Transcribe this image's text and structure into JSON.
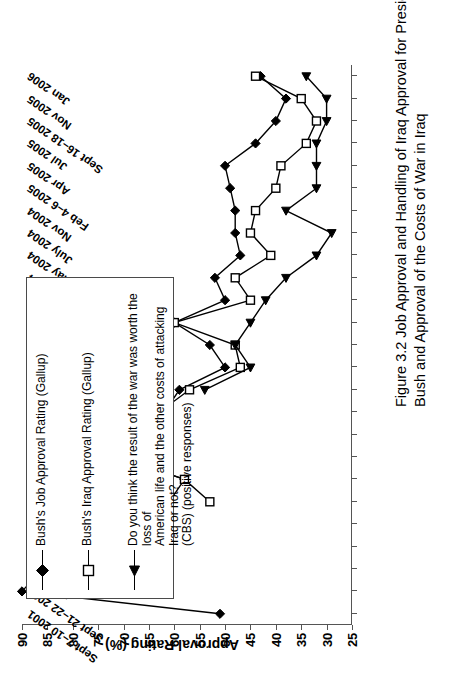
{
  "figure": {
    "caption_line1": "Figure 3.2  Job Approval and Handling of Iraq Approval for President",
    "caption_line2": "Bush and Approval of the Costs of War in Iraq"
  },
  "legend": {
    "items": [
      {
        "marker": "filled-diamond",
        "label": "Bush's Job Approval Rating  (Gallup)"
      },
      {
        "marker": "open-square",
        "label": "Bush's Iraq Approval Rating  (Gallup)"
      },
      {
        "marker": "filled-triangle",
        "label": "Do you think the result of the war was worth the loss of\nAmerican life and the other costs of attacking Iraq or not?\n(CBS) (positive responses)"
      }
    ]
  },
  "chart_data": {
    "type": "line",
    "title": "Job Approval and Handling of Iraq Approval for President Bush and Approval of the Costs of War in Iraq",
    "xlabel": "",
    "ylabel": "Approval Rating (%)",
    "ylim": [
      25,
      90
    ],
    "yticks": [
      25,
      30,
      35,
      40,
      45,
      50,
      55,
      60,
      65,
      70,
      75,
      80,
      85,
      90
    ],
    "grid": false,
    "legend_position": "top-left",
    "orientation": "page-rotated-90ccw",
    "categories": [
      "Sept 7–10 2001",
      "Sept 21–22 2001",
      "Dec 2001",
      "June 2002",
      "Oct 2002",
      "Feb 2003",
      "Mar 14–15 2003",
      "Mar 22–23 2003",
      "Apr 2003",
      "June 2003",
      "Aug 2003",
      "Nov 2003",
      "Dec 2003",
      "Jan 2–5 2004",
      "Mar 2004",
      "Apr 2004",
      "May 2004",
      "July 2004",
      "Nov 2004",
      "Feb 4–6 2005",
      "Apr 2005",
      "Jul 2005",
      "Sept 16–18 2005",
      "Nov 2005",
      "Jan 2006"
    ],
    "series": [
      {
        "name": "Bush's Job Approval Rating  (Gallup)",
        "marker": "filled-diamond",
        "values": [
          51,
          90,
          86,
          73,
          67,
          61,
          58,
          71,
          71,
          62,
          59,
          50,
          53,
          60,
          50,
          52,
          47,
          48,
          48,
          49,
          50,
          44,
          40,
          38,
          43
        ]
      },
      {
        "name": "Bush's Iraq Approval Rating  (Gallup)",
        "marker": "open-square",
        "values": [
          null,
          null,
          null,
          null,
          null,
          53,
          58,
          71,
          76,
          63,
          57,
          47,
          48,
          60,
          45,
          48,
          41,
          45,
          44,
          40,
          39,
          34,
          32,
          35,
          44
        ]
      },
      {
        "name": "Do you think the result of the war was worth the loss of American life and the other costs of attacking Iraq or not? (CBS) (positive responses)",
        "marker": "filled-triangle",
        "values": [
          null,
          null,
          null,
          null,
          null,
          null,
          null,
          null,
          null,
          null,
          54,
          45,
          48,
          45,
          42,
          38,
          32,
          29,
          38,
          32,
          32,
          32,
          30,
          30,
          34
        ]
      }
    ]
  }
}
